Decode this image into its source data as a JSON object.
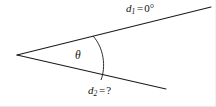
{
  "figure": {
    "kind": "angle-wedge-diagram",
    "title": "",
    "background_color": "#ffffff",
    "stroke_color": "#1a1a1a",
    "text_color": "#111111",
    "vertex": {
      "x": 17,
      "y": 55
    },
    "rays": [
      {
        "name": "upper-ray",
        "label_variable": "d",
        "label_subscript": "1",
        "label_equals": "=",
        "label_value": "0°",
        "label_text": "d1 = 0°",
        "start": {
          "x": 17,
          "y": 55
        },
        "end": {
          "x": 211,
          "y": 7
        }
      },
      {
        "name": "lower-ray",
        "label_variable": "d",
        "label_subscript": "2",
        "label_equals": "=",
        "label_value": "?",
        "label_text": "d2 = ?",
        "start": {
          "x": 17,
          "y": 55
        },
        "end": {
          "x": 166,
          "y": 89
        }
      }
    ],
    "arc": {
      "name": "angle-arc",
      "label": "θ",
      "from": {
        "x": 93,
        "y": 36
      },
      "to": {
        "x": 101,
        "y": 80
      },
      "radius": 82
    }
  }
}
